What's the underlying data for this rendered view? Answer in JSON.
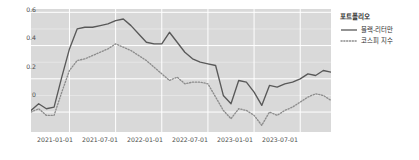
{
  "legend": {
    "title": "포트폴리오",
    "items": [
      {
        "label": "블랙-리터만",
        "style": "solid",
        "color": "#595959"
      },
      {
        "label": "코스피 지수",
        "style": "dotted",
        "color": "#8c8c8c"
      }
    ]
  },
  "axes": {
    "y_ticks": [
      "0.6",
      "0.4",
      "0.2",
      "0"
    ],
    "x_ticks": [
      "2021-01-01",
      "2021-07-01",
      "2022-01-01",
      "2022-07-01",
      "2023-01-01",
      "2023-07-01"
    ]
  },
  "chart_data": {
    "type": "line",
    "title": "",
    "xlabel": "",
    "ylabel": "",
    "ylim": [
      -0.12,
      0.62
    ],
    "xlim": [
      "2020-08-01",
      "2023-12-01"
    ],
    "grid": true,
    "legend_position": "right",
    "legend_title": "포트폴리오",
    "panel_background": "#d9d9d9",
    "gridline_color": "#ffffff",
    "x": [
      "2020-08-01",
      "2020-09-01",
      "2020-10-01",
      "2020-11-01",
      "2020-12-01",
      "2021-01-01",
      "2021-02-01",
      "2021-03-01",
      "2021-04-01",
      "2021-05-01",
      "2021-06-01",
      "2021-07-01",
      "2021-08-01",
      "2021-09-01",
      "2021-10-01",
      "2021-11-01",
      "2021-12-01",
      "2022-01-01",
      "2022-02-01",
      "2022-03-01",
      "2022-04-01",
      "2022-05-01",
      "2022-06-01",
      "2022-07-01",
      "2022-08-01",
      "2022-09-01",
      "2022-10-01",
      "2022-11-01",
      "2022-12-01",
      "2023-01-01",
      "2023-02-01",
      "2023-03-01",
      "2023-04-01",
      "2023-05-01",
      "2023-06-01",
      "2023-07-01",
      "2023-08-01",
      "2023-09-01",
      "2023-10-01",
      "2023-11-01"
    ],
    "series": [
      {
        "name": "블랙-리터만",
        "style": "solid",
        "color": "#595959",
        "values": [
          0.01,
          0.05,
          0.02,
          0.03,
          0.21,
          0.38,
          0.5,
          0.51,
          0.51,
          0.52,
          0.53,
          0.55,
          0.56,
          0.52,
          0.47,
          0.42,
          0.41,
          0.41,
          0.48,
          0.42,
          0.36,
          0.32,
          0.3,
          0.29,
          0.28,
          0.1,
          0.05,
          0.19,
          0.18,
          0.12,
          0.04,
          0.16,
          0.15,
          0.17,
          0.18,
          0.2,
          0.23,
          0.22,
          0.25,
          0.24
        ]
      },
      {
        "name": "코스피 지수",
        "style": "dotted",
        "color": "#8c8c8c",
        "values": [
          0.0,
          0.02,
          -0.02,
          -0.02,
          0.12,
          0.25,
          0.31,
          0.32,
          0.34,
          0.36,
          0.38,
          0.41,
          0.39,
          0.37,
          0.34,
          0.31,
          0.27,
          0.23,
          0.19,
          0.21,
          0.17,
          0.18,
          0.18,
          0.17,
          0.09,
          0.01,
          -0.04,
          0.02,
          0.01,
          -0.02,
          -0.08,
          0.0,
          -0.02,
          0.01,
          0.03,
          0.06,
          0.09,
          0.11,
          0.1,
          0.07
        ]
      }
    ]
  }
}
